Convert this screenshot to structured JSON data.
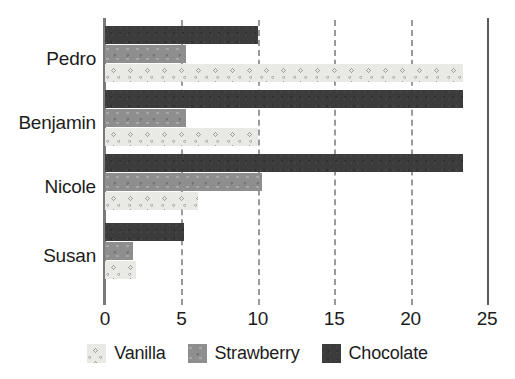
{
  "chart_data": {
    "type": "bar",
    "orientation": "horizontal",
    "title": "",
    "xlabel": "",
    "ylabel": "",
    "categories": [
      "Pedro",
      "Benjamin",
      "Nicole",
      "Susan"
    ],
    "series": [
      {
        "name": "Vanilla",
        "color": "#e9e9e6",
        "values": [
          23.4,
          10.0,
          6.1,
          2.0
        ]
      },
      {
        "name": "Strawberry",
        "color": "#8e8e8e",
        "values": [
          5.3,
          5.3,
          10.3,
          1.8
        ]
      },
      {
        "name": "Chocolate",
        "color": "#3c3c3c",
        "values": [
          10.0,
          23.4,
          23.4,
          5.2
        ]
      }
    ],
    "xlim": [
      0,
      25
    ],
    "xticks": [
      0,
      5,
      10,
      15,
      20,
      25
    ],
    "xtick_labels": [
      "0",
      "5",
      "10",
      "15",
      "20",
      "25"
    ],
    "grid": true,
    "grid_axis": "x",
    "grid_style": "dashed",
    "grid_color": "#9a9a9a",
    "legend_position": "bottom",
    "bar_order_top_to_bottom": [
      "Chocolate",
      "Strawberry",
      "Vanilla"
    ]
  },
  "legend": {
    "items": [
      {
        "label": "Vanilla",
        "swatch": "vanilla"
      },
      {
        "label": "Strawberry",
        "swatch": "strawberry"
      },
      {
        "label": "Chocolate",
        "swatch": "chocolate"
      }
    ]
  },
  "axis": {
    "tick_labels": [
      "0",
      "5",
      "10",
      "15",
      "20",
      "25"
    ]
  },
  "categories": {
    "labels": [
      "Pedro",
      "Benjamin",
      "Nicole",
      "Susan"
    ]
  }
}
